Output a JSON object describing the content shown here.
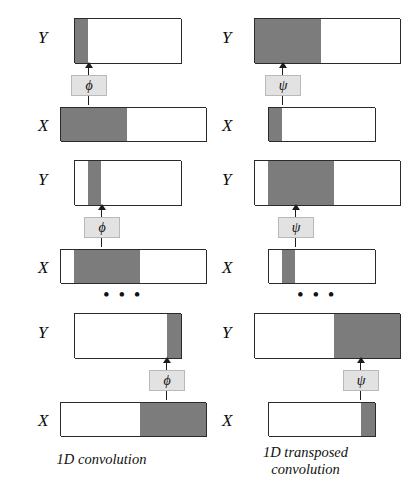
{
  "figure": {
    "colors": {
      "cell_fill_light": "#ffffff",
      "cell_fill_dark": "#7c7c7c",
      "cell_border": "#2b2b2b",
      "op_box_fill": "#e2e2e2",
      "op_box_border": "#b9b9b9",
      "arrow": "#1c1c1c",
      "text": "#101010",
      "background": "#ffffff"
    },
    "ellipsis_glyph": "• • •"
  },
  "panels": [
    {
      "id": "panel-1d-convolution",
      "caption": "1D convolution",
      "operator_symbol": "ϕ",
      "operator_name": "phi",
      "blocks": [
        {
          "id": "conv-block-1",
          "output": {
            "label": "Y",
            "rows": 4,
            "cols": 8,
            "highlight_cols": [
              1
            ],
            "highlight_kind": "single-output"
          },
          "input": {
            "label": "X",
            "rows": 3,
            "cols": 11,
            "highlight_cols": [
              1,
              2,
              3,
              4,
              5
            ],
            "highlight_kind": "receptive-field"
          },
          "arrow_at_col": 1
        },
        {
          "id": "conv-block-2",
          "output": {
            "label": "Y",
            "rows": 4,
            "cols": 8,
            "highlight_cols": [
              2
            ],
            "highlight_kind": "single-output"
          },
          "input": {
            "label": "X",
            "rows": 3,
            "cols": 11,
            "highlight_cols": [
              2,
              3,
              4,
              5,
              6
            ],
            "highlight_kind": "receptive-field"
          },
          "arrow_at_col": 2
        },
        {
          "id": "conv-block-last",
          "output": {
            "label": "Y",
            "rows": 4,
            "cols": 8,
            "highlight_cols": [
              8
            ],
            "highlight_kind": "single-output"
          },
          "input": {
            "label": "X",
            "rows": 3,
            "cols": 11,
            "highlight_cols": [
              7,
              8,
              9,
              10,
              11
            ],
            "highlight_kind": "receptive-field"
          },
          "arrow_at_col": 8
        }
      ]
    },
    {
      "id": "panel-1d-transposed-convolution",
      "caption_line_1": "1D transposed",
      "caption_line_2": "convolution",
      "operator_symbol": "ψ",
      "operator_name": "psi",
      "blocks": [
        {
          "id": "transposed-block-1",
          "output": {
            "label": "Y",
            "rows": 4,
            "cols": 11,
            "highlight_cols": [
              1,
              2,
              3,
              4,
              5
            ],
            "highlight_kind": "projected-field"
          },
          "input": {
            "label": "X",
            "rows": 3,
            "cols": 8,
            "highlight_cols": [
              1
            ],
            "highlight_kind": "single-input"
          },
          "arrow_at_col": 1
        },
        {
          "id": "transposed-block-2",
          "output": {
            "label": "Y",
            "rows": 4,
            "cols": 11,
            "highlight_cols": [
              2,
              3,
              4,
              5,
              6
            ],
            "highlight_kind": "projected-field"
          },
          "input": {
            "label": "X",
            "rows": 3,
            "cols": 8,
            "highlight_cols": [
              2
            ],
            "highlight_kind": "single-input"
          },
          "arrow_at_col": 2
        },
        {
          "id": "transposed-block-last",
          "output": {
            "label": "Y",
            "rows": 4,
            "cols": 11,
            "highlight_cols": [
              7,
              8,
              9,
              10,
              11
            ],
            "highlight_kind": "projected-field"
          },
          "input": {
            "label": "X",
            "rows": 3,
            "cols": 8,
            "highlight_cols": [
              8
            ],
            "highlight_kind": "single-input"
          },
          "arrow_at_col": 8
        }
      ]
    }
  ]
}
